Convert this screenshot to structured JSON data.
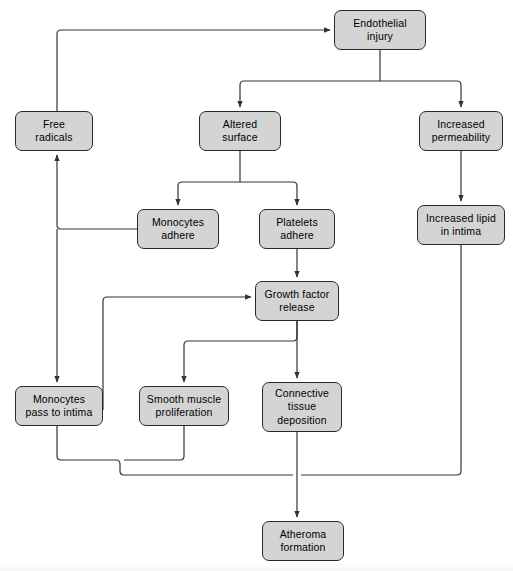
{
  "diagram": {
    "theme": {
      "node_fill": "#d4d4d4",
      "node_stroke": "#2a2a2a",
      "connector_stroke": "#333333",
      "background": "#ffffff",
      "text_color": "#000000"
    },
    "nodes": [
      {
        "id": "endothelial-injury",
        "label": "Endothelial\ninjury",
        "x": 334,
        "y": 10,
        "w": 92,
        "h": 40
      },
      {
        "id": "free-radicals",
        "label": "Free\nradicals",
        "x": 15,
        "y": 111,
        "w": 78,
        "h": 40
      },
      {
        "id": "altered-surface",
        "label": "Altered\nsurface",
        "x": 199,
        "y": 111,
        "w": 82,
        "h": 40
      },
      {
        "id": "increased-permeability",
        "label": "Increased\npermeability",
        "x": 419,
        "y": 111,
        "w": 84,
        "h": 40
      },
      {
        "id": "monocytes-adhere",
        "label": "Monocytes\nadhere",
        "x": 137,
        "y": 209,
        "w": 82,
        "h": 40
      },
      {
        "id": "platelets-adhere",
        "label": "Platelets\nadhere",
        "x": 259,
        "y": 209,
        "w": 76,
        "h": 40
      },
      {
        "id": "increased-lipid-in-intima",
        "label": "Increased lipid\nin intima",
        "x": 417,
        "y": 205,
        "w": 88,
        "h": 40
      },
      {
        "id": "growth-factor-release",
        "label": "Growth factor\nrelease",
        "x": 255,
        "y": 281,
        "w": 84,
        "h": 40
      },
      {
        "id": "monocytes-pass-to-intima",
        "label": "Monocytes\npass to intima",
        "x": 15,
        "y": 386,
        "w": 88,
        "h": 40
      },
      {
        "id": "smooth-muscle-proliferation",
        "label": "Smooth muscle\nproliferation",
        "x": 139,
        "y": 386,
        "w": 90,
        "h": 40
      },
      {
        "id": "connective-tissue-deposition",
        "label": "Connective\ntissue\ndeposition",
        "x": 262,
        "y": 382,
        "w": 80,
        "h": 50
      },
      {
        "id": "atheroma-formation",
        "label": "Atheroma\nformation",
        "x": 262,
        "y": 521,
        "w": 82,
        "h": 40
      }
    ],
    "edges": [
      {
        "id": "free-radicals-to-endothelial-injury",
        "from": "free-radicals",
        "to": "endothelial-injury"
      },
      {
        "id": "endothelial-injury-to-altered-surface",
        "from": "endothelial-injury",
        "to": "altered-surface"
      },
      {
        "id": "endothelial-injury-to-increased-permeability",
        "from": "endothelial-injury",
        "to": "increased-permeability"
      },
      {
        "id": "altered-surface-to-monocytes-adhere",
        "from": "altered-surface",
        "to": "monocytes-adhere"
      },
      {
        "id": "altered-surface-to-platelets-adhere",
        "from": "altered-surface",
        "to": "platelets-adhere"
      },
      {
        "id": "increased-permeability-to-increased-lipid",
        "from": "increased-permeability",
        "to": "increased-lipid-in-intima"
      },
      {
        "id": "monocytes-adhere-to-free-radicals",
        "from": "monocytes-adhere",
        "to": "free-radicals"
      },
      {
        "id": "monocytes-adhere-to-monocytes-pass-to-intima",
        "from": "monocytes-adhere",
        "to": "monocytes-pass-to-intima"
      },
      {
        "id": "platelets-adhere-to-growth-factor-release",
        "from": "platelets-adhere",
        "to": "growth-factor-release"
      },
      {
        "id": "monocytes-pass-to-intima-to-growth-factor",
        "from": "monocytes-pass-to-intima",
        "to": "growth-factor-release"
      },
      {
        "id": "growth-factor-to-smooth-muscle-proliferation",
        "from": "growth-factor-release",
        "to": "smooth-muscle-proliferation"
      },
      {
        "id": "growth-factor-to-connective-tissue-deposition",
        "from": "growth-factor-release",
        "to": "connective-tissue-deposition"
      },
      {
        "id": "monocytes-pass-to-intima-to-atheroma",
        "from": "monocytes-pass-to-intima",
        "to": "atheroma-formation"
      },
      {
        "id": "smooth-muscle-proliferation-to-atheroma",
        "from": "smooth-muscle-proliferation",
        "to": "atheroma-formation"
      },
      {
        "id": "connective-tissue-deposition-to-atheroma",
        "from": "connective-tissue-deposition",
        "to": "atheroma-formation"
      },
      {
        "id": "increased-lipid-to-atheroma",
        "from": "increased-lipid-in-intima",
        "to": "atheroma-formation"
      }
    ]
  }
}
